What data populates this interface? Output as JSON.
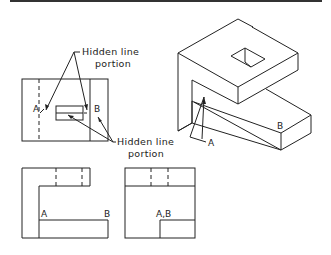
{
  "figure": {
    "type": "orthographic-and-isometric-drawing",
    "top_rule_color": "#333333",
    "line_color": "#222222"
  },
  "annotations": {
    "hidden_top": {
      "line1": "Hidden line",
      "line2": "portion"
    },
    "hidden_bottom": {
      "line1": "Hidden line",
      "line2": "portion"
    }
  },
  "views": {
    "top_view": {
      "label_a": "A",
      "label_b": "B"
    },
    "front_view": {
      "label_a": "A",
      "label_b": "B"
    },
    "side_view": {
      "label_ab": "A,B"
    },
    "isometric": {
      "label_a": "A",
      "label_b": "B"
    }
  }
}
